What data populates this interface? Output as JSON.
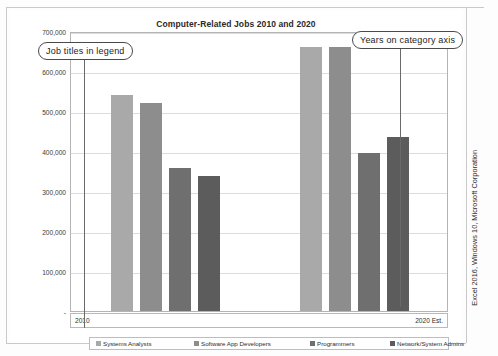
{
  "chart_data": {
    "type": "bar",
    "title": "Computer-Related Jobs 2010 and 2020",
    "xlabel": "",
    "ylabel": "",
    "categories": [
      "2010",
      "2020 Est."
    ],
    "series": [
      {
        "name": "Systems Analysts",
        "color": "#a9a9a9",
        "values": [
          539000,
          661000
        ]
      },
      {
        "name": "Software App Developers",
        "color": "#8d8d8d",
        "values": [
          520000,
          661000
        ]
      },
      {
        "name": "Programmers",
        "color": "#6f6f6f",
        "values": [
          357000,
          394000
        ]
      },
      {
        "name": "Network/System Admins",
        "color": "#5c5c5c",
        "values": [
          338000,
          434000
        ]
      }
    ],
    "ylim": [
      0,
      700000
    ],
    "ytick_labels": [
      "700,000",
      "600,000",
      "500,000",
      "400,000",
      "300,000",
      "200,000",
      "100,000",
      "-"
    ],
    "ytick_values": [
      700000,
      600000,
      500000,
      400000,
      300000,
      200000,
      100000,
      0
    ],
    "grid": true,
    "legend_position": "bottom"
  },
  "annotations": [
    {
      "id": "legend-callout",
      "text": "Job titles in legend"
    },
    {
      "id": "years-callout",
      "text": "Years on category axis"
    }
  ],
  "caption": {
    "source": "Excel 2016, Windows 10, Microsoft Corporation"
  }
}
